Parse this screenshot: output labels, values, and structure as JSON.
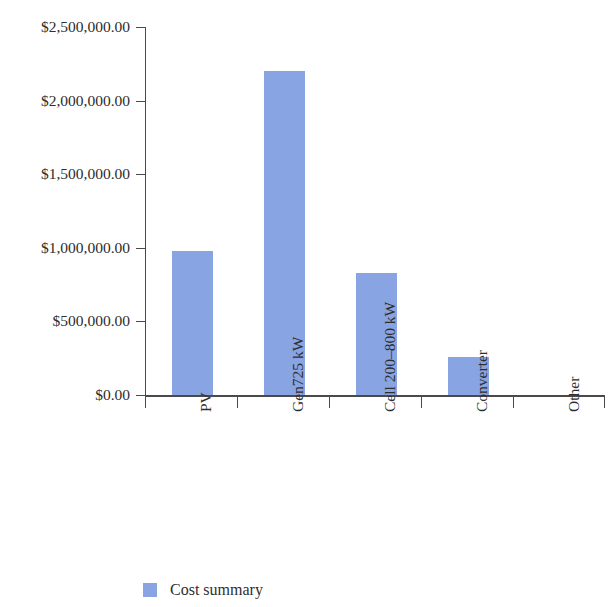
{
  "chart_data": {
    "type": "bar",
    "title": "",
    "subtitle": "",
    "xlabel": "",
    "ylabel": "",
    "categories": [
      "PV",
      "Gen725 kW",
      "Cell 200–800 kW",
      "Converter",
      "Other"
    ],
    "values": [
      975000,
      2200000,
      830000,
      255000,
      0
    ],
    "series": [
      {
        "name": "Cost summary",
        "color": "#89a4e3",
        "values": [
          975000,
          2200000,
          830000,
          255000,
          0
        ]
      }
    ],
    "ylim": [
      0,
      2500000
    ],
    "ytick_values": [
      0,
      500000,
      1000000,
      1500000,
      2000000,
      2500000
    ],
    "ytick_labels": [
      "$0.00",
      "$500,000.00",
      "$1,000,000.00",
      "$1,500,000.00",
      "$2,000,000.00",
      "$2,500,000.00"
    ],
    "grid": false,
    "legend_position": "bottom-left",
    "legend_entries": [
      {
        "label": "Cost summary",
        "color": "#89a4e3"
      }
    ],
    "axis_color": "#4a4a4a",
    "background": "#ffffff",
    "xtick_label_rotation": 90
  },
  "legend": {
    "label": "Cost summary"
  },
  "yticks": {
    "t0": "$2,500,000.00",
    "t1": "$2,000,000.00",
    "t2": "$1,500,000.00",
    "t3": "$1,000,000.00",
    "t4": "$500,000.00",
    "t5": "$0.00"
  },
  "xticks": {
    "c0": "PV",
    "c1": "Gen725 kW",
    "c2": "Cell 200–800 kW",
    "c3": "Converter",
    "c4": "Other"
  }
}
